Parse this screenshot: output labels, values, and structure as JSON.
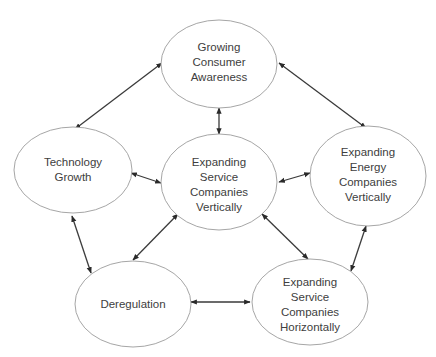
{
  "diagram": {
    "type": "cycle-network",
    "colors": {
      "ellipse_stroke": "#a6a6a6",
      "edge": "#3a3a3a",
      "text": "#404040",
      "background": "#ffffff"
    },
    "nodes": [
      {
        "id": "consumer",
        "lines": [
          "Growing",
          "Consumer",
          "Awareness"
        ]
      },
      {
        "id": "tech",
        "lines": [
          "Technology",
          "Growth"
        ]
      },
      {
        "id": "service_vert",
        "lines": [
          "Expanding",
          "Service",
          "Companies",
          "Vertically"
        ]
      },
      {
        "id": "energy_vert",
        "lines": [
          "Expanding",
          "Energy",
          "Companies",
          "Vertically"
        ]
      },
      {
        "id": "dereg",
        "lines": [
          "Deregulation"
        ]
      },
      {
        "id": "service_horiz",
        "lines": [
          "Expanding",
          "Service",
          "Companies",
          "Horizontally"
        ]
      }
    ],
    "edges": [
      {
        "from": "consumer",
        "to": "tech",
        "bidirectional": true
      },
      {
        "from": "consumer",
        "to": "energy_vert",
        "bidirectional": true
      },
      {
        "from": "consumer",
        "to": "service_vert",
        "bidirectional": true
      },
      {
        "from": "tech",
        "to": "service_vert",
        "bidirectional": true
      },
      {
        "from": "service_vert",
        "to": "energy_vert",
        "bidirectional": true
      },
      {
        "from": "tech",
        "to": "dereg",
        "bidirectional": true
      },
      {
        "from": "service_vert",
        "to": "dereg",
        "bidirectional": true
      },
      {
        "from": "service_vert",
        "to": "service_horiz",
        "bidirectional": true
      },
      {
        "from": "energy_vert",
        "to": "service_horiz",
        "bidirectional": true
      },
      {
        "from": "dereg",
        "to": "service_horiz",
        "bidirectional": true
      }
    ]
  }
}
